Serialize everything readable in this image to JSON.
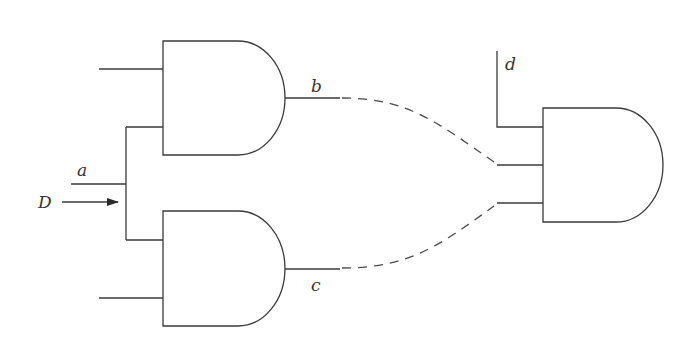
{
  "diagram": {
    "type": "logic-circuit",
    "labels": {
      "a": "a",
      "b": "b",
      "c": "c",
      "d": "d",
      "D": "D"
    },
    "gates": [
      {
        "id": "and-gate-1",
        "kind": "AND",
        "inputs": 2,
        "output_label": "b"
      },
      {
        "id": "and-gate-2",
        "kind": "AND",
        "inputs": 2,
        "output_label": "c"
      },
      {
        "id": "and-gate-3",
        "kind": "AND",
        "inputs": 3,
        "input_labels": [
          "d",
          "b",
          "c"
        ]
      }
    ],
    "connections": [
      {
        "from": "a",
        "to": [
          "and-gate-1.input-2",
          "and-gate-2.input-1"
        ],
        "style": "solid"
      },
      {
        "from": "and-gate-1.output",
        "to": "and-gate-3.input-2",
        "style": "dashed"
      },
      {
        "from": "and-gate-2.output",
        "to": "and-gate-3.input-3",
        "style": "dashed"
      },
      {
        "from": "d",
        "to": "and-gate-3.input-1",
        "style": "solid"
      }
    ],
    "annotations": [
      {
        "text": "D",
        "kind": "arrow",
        "points_to": "branch-node-a"
      }
    ],
    "colors": {
      "line": "#3a3a3a",
      "background": "#ffffff"
    }
  }
}
